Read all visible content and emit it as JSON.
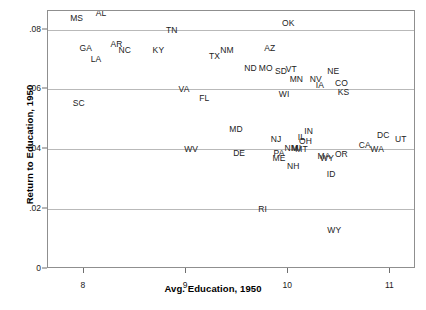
{
  "chart_data": {
    "type": "scatter",
    "title": "",
    "xlabel": "Avg. Education, 1950",
    "ylabel": "Return to Education, 1950",
    "xlim": [
      7.65,
      11.25
    ],
    "ylim": [
      0,
      0.0862
    ],
    "xticks": [
      "8",
      "9",
      "10",
      "11"
    ],
    "xtickvalues": [
      8,
      9,
      10,
      11
    ],
    "yticks": [
      "0",
      ".02",
      ".04",
      ".06",
      ".08"
    ],
    "ytickvalues": [
      0,
      0.02,
      0.04,
      0.06,
      0.08
    ],
    "grid": "horizontal",
    "legend": "none",
    "marker": "text-label",
    "points": [
      {
        "label": "MS",
        "x": 7.93,
        "y": 0.0838
      },
      {
        "label": "AL",
        "x": 8.17,
        "y": 0.0855
      },
      {
        "label": "TN",
        "x": 8.86,
        "y": 0.08
      },
      {
        "label": "OK",
        "x": 10.0,
        "y": 0.0821
      },
      {
        "label": "AR",
        "x": 8.32,
        "y": 0.0752
      },
      {
        "label": "GA",
        "x": 8.02,
        "y": 0.0738
      },
      {
        "label": "NC",
        "x": 8.4,
        "y": 0.0731
      },
      {
        "label": "KY",
        "x": 8.73,
        "y": 0.0731
      },
      {
        "label": "NM",
        "x": 9.4,
        "y": 0.0731
      },
      {
        "label": "AZ",
        "x": 9.82,
        "y": 0.0738
      },
      {
        "label": "TX",
        "x": 9.28,
        "y": 0.071
      },
      {
        "label": "LA",
        "x": 8.12,
        "y": 0.0703
      },
      {
        "label": "ND",
        "x": 9.63,
        "y": 0.0672
      },
      {
        "label": "MO",
        "x": 9.78,
        "y": 0.0672
      },
      {
        "label": "SD",
        "x": 9.93,
        "y": 0.0662
      },
      {
        "label": "VT",
        "x": 10.03,
        "y": 0.0669
      },
      {
        "label": "NE",
        "x": 10.44,
        "y": 0.0662
      },
      {
        "label": "MN",
        "x": 10.08,
        "y": 0.0634
      },
      {
        "label": "NV",
        "x": 10.27,
        "y": 0.0634
      },
      {
        "label": "VA",
        "x": 8.98,
        "y": 0.06
      },
      {
        "label": "CO",
        "x": 10.52,
        "y": 0.0621
      },
      {
        "label": "IA",
        "x": 10.31,
        "y": 0.0614
      },
      {
        "label": "KS",
        "x": 10.54,
        "y": 0.0593
      },
      {
        "label": "WI",
        "x": 9.96,
        "y": 0.0586
      },
      {
        "label": "FL",
        "x": 9.18,
        "y": 0.0572
      },
      {
        "label": "SC",
        "x": 7.95,
        "y": 0.0555
      },
      {
        "label": "MD",
        "x": 9.49,
        "y": 0.0469
      },
      {
        "label": "DC",
        "x": 10.93,
        "y": 0.0448
      },
      {
        "label": "IN",
        "x": 10.2,
        "y": 0.0462
      },
      {
        "label": "UT",
        "x": 11.1,
        "y": 0.0434
      },
      {
        "label": "NJ",
        "x": 9.88,
        "y": 0.0434
      },
      {
        "label": "IL",
        "x": 10.13,
        "y": 0.0441
      },
      {
        "label": "OH",
        "x": 10.17,
        "y": 0.0427
      },
      {
        "label": "MI",
        "x": 10.08,
        "y": 0.0403
      },
      {
        "label": "MT",
        "x": 10.13,
        "y": 0.04
      },
      {
        "label": "NM2",
        "x": 10.03,
        "y": 0.0403
      },
      {
        "label": "CA",
        "x": 10.75,
        "y": 0.0414
      },
      {
        "label": "WV",
        "x": 9.05,
        "y": 0.04
      },
      {
        "label": "WA",
        "x": 10.87,
        "y": 0.04
      },
      {
        "label": "PA",
        "x": 9.91,
        "y": 0.0386
      },
      {
        "label": "DE",
        "x": 9.52,
        "y": 0.0386
      },
      {
        "label": "ME",
        "x": 9.91,
        "y": 0.0372
      },
      {
        "label": "MA",
        "x": 10.35,
        "y": 0.0379
      },
      {
        "label": "WY2",
        "x": 10.38,
        "y": 0.0372
      },
      {
        "label": "OR",
        "x": 10.52,
        "y": 0.0383
      },
      {
        "label": "NH",
        "x": 10.05,
        "y": 0.0345
      },
      {
        "label": "ID",
        "x": 10.42,
        "y": 0.0317
      },
      {
        "label": "RI",
        "x": 9.75,
        "y": 0.02
      },
      {
        "label": "WY",
        "x": 10.45,
        "y": 0.0131
      }
    ]
  },
  "labels": {
    "MS": "MS",
    "AL": "AL",
    "TN": "TN",
    "OK": "OK",
    "AR": "AR",
    "GA": "GA",
    "NC": "NC",
    "KY": "KY",
    "NM": "NM",
    "AZ": "AZ",
    "TX": "TX",
    "LA": "LA",
    "ND": "ND",
    "MO": "MO",
    "SD": "SD",
    "VT": "VT",
    "NE": "NE",
    "MN": "MN",
    "NV": "NV",
    "VA": "VA",
    "CO": "CO",
    "IA": "IA",
    "KS": "KS",
    "WI": "WI",
    "FL": "FL",
    "SC": "SC",
    "MD": "MD",
    "DC": "DC",
    "IN": "IN",
    "UT": "UT",
    "NJ": "NJ",
    "IL": "IL",
    "OH": "OH",
    "MI": "MI",
    "MT": "MT",
    "NM2": "NM",
    "CA": "CA",
    "WV": "WV",
    "WA": "WA",
    "PA": "PA",
    "DE": "DE",
    "ME": "ME",
    "MA": "MA",
    "WY2": "WY",
    "OR": "OR",
    "NH": "NH",
    "ID": "ID",
    "RI": "RI",
    "WY": "WY"
  },
  "colors": {
    "background": "#ffffff",
    "frame": "#8f8f8f",
    "gridline": "#b9b9b9",
    "text": "#222222",
    "axis_title": "#000000"
  }
}
